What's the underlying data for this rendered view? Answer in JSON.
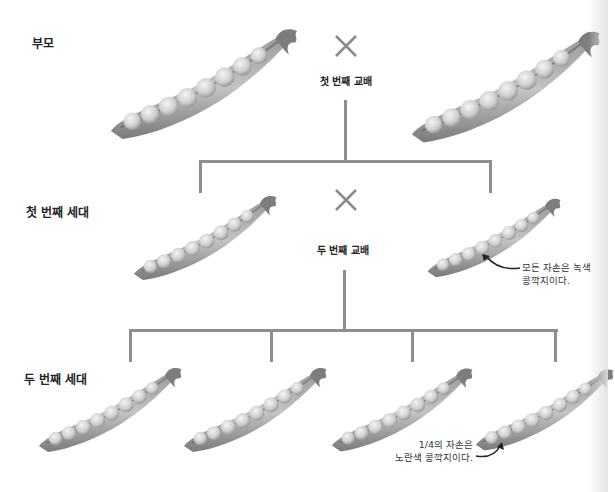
{
  "top_caption": "",
  "generations": {
    "parents": "부모",
    "first": "첫 번째 세대",
    "second": "두 번째 세대"
  },
  "crosses": {
    "first": "첫 번째 교배",
    "second": "두 번째 교배"
  },
  "annotations": {
    "first_gen_line1": "모든 자손은 녹색",
    "first_gen_line2": "콩깍지이다.",
    "second_gen_line1": "1/4의 자손은",
    "second_gen_line2": "노란색 콩깍지이다."
  },
  "colors": {
    "line": "#8e8e8e",
    "cross": "#8a8a8a",
    "pod_dark": "#6e6e6e",
    "pod_light": "#d8d8d8",
    "pea": "#cfcfcf"
  },
  "pods": [
    {
      "id": "parent-left",
      "generation": "parents",
      "peas": 8
    },
    {
      "id": "parent-right",
      "generation": "parents",
      "peas": 8
    },
    {
      "id": "f1-left",
      "generation": "first",
      "peas": 8
    },
    {
      "id": "f1-right",
      "generation": "first",
      "peas": 8
    },
    {
      "id": "f2-1",
      "generation": "second",
      "peas": 8
    },
    {
      "id": "f2-2",
      "generation": "second",
      "peas": 8
    },
    {
      "id": "f2-3",
      "generation": "second",
      "peas": 8
    },
    {
      "id": "f2-4",
      "generation": "second",
      "peas": 8,
      "highlight": "yellow"
    }
  ]
}
